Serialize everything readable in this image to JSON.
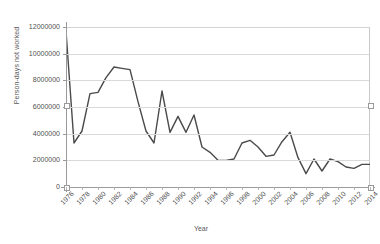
{
  "chart_data": {
    "type": "line",
    "title": "",
    "xlabel": "Year",
    "ylabel": "Person-days not worked",
    "xlim": [
      1976,
      2014
    ],
    "ylim": [
      0,
      12000000
    ],
    "ytick_step": 2000000,
    "xtick_step": 2,
    "grid": true,
    "legend": "none",
    "series_color": "#4a4a4a",
    "ytick_labels": [
      "0",
      "2000000",
      "4000000",
      "6000000",
      "8000000",
      "10000000",
      "12000000"
    ],
    "xtick_labels": [
      "1976",
      "1978",
      "1980",
      "1982",
      "1984",
      "1986",
      "1988",
      "1990",
      "1992",
      "1994",
      "1996",
      "1998",
      "2000",
      "2002",
      "2004",
      "2006",
      "2008",
      "2010",
      "2012",
      "2014"
    ],
    "x": [
      1976,
      1977,
      1978,
      1979,
      1980,
      1981,
      1982,
      1983,
      1984,
      1985,
      1986,
      1987,
      1988,
      1989,
      1990,
      1991,
      1992,
      1993,
      1994,
      1995,
      1996,
      1997,
      1998,
      1999,
      2000,
      2001,
      2002,
      2003,
      2004,
      2005,
      2006,
      2007,
      2008,
      2009,
      2010,
      2011,
      2012,
      2013,
      2014
    ],
    "values": [
      11700000,
      3300000,
      4200000,
      7000000,
      7100000,
      8200000,
      9000000,
      8900000,
      8800000,
      6400000,
      4200000,
      3300000,
      7200000,
      4100000,
      5300000,
      4100000,
      5400000,
      3000000,
      2600000,
      2000000,
      2000000,
      2100000,
      3300000,
      3500000,
      3000000,
      2300000,
      2400000,
      3400000,
      4100000,
      2200000,
      1000000,
      2100000,
      1200000,
      2100000,
      1900000,
      1500000,
      1400000,
      1700000,
      1700000
    ]
  }
}
